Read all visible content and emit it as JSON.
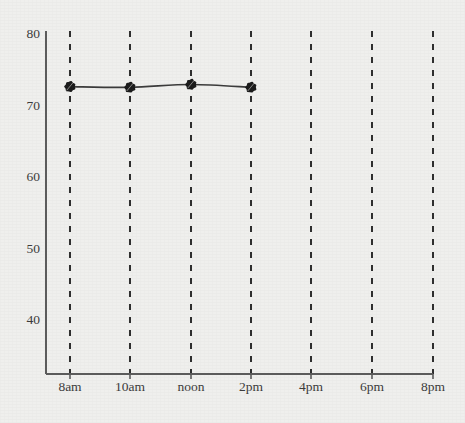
{
  "chart_data": {
    "type": "line",
    "title": "",
    "subtitle": "",
    "xlabel": "",
    "ylabel": "",
    "grid": "vertical-dashed",
    "legend": "none",
    "background_color": "#efefed",
    "line_color": "#3a3a3a",
    "marker_color": "#1a1a1a",
    "grid_color": "#2e2e2e",
    "axis_color": "#555555",
    "xlim_labels": [
      "8am",
      "8pm"
    ],
    "ylim": [
      33,
      80
    ],
    "yticks": [
      80,
      70,
      60,
      50,
      40
    ],
    "ytick_labels": [
      "80",
      "70",
      "60",
      "50",
      "40"
    ],
    "xticks": [
      "8am",
      "10am",
      "noon",
      "2pm",
      "4pm",
      "6pm",
      "8pm"
    ],
    "x": [
      "8am",
      "10am",
      "noon",
      "2pm"
    ],
    "values": [
      72.5,
      72.4,
      72.8,
      72.4
    ],
    "series": [
      {
        "name": "temperature",
        "points": [
          {
            "x": "8am",
            "y": 72.5
          },
          {
            "x": "10am",
            "y": 72.4
          },
          {
            "x": "noon",
            "y": 72.8
          },
          {
            "x": "2pm",
            "y": 72.4
          }
        ]
      }
    ]
  },
  "axes": {
    "y_labels": [
      "80",
      "70",
      "60",
      "50",
      "40"
    ],
    "x_labels": [
      "8am",
      "10am",
      "noon",
      "2pm",
      "4pm",
      "6pm",
      "8pm"
    ]
  }
}
